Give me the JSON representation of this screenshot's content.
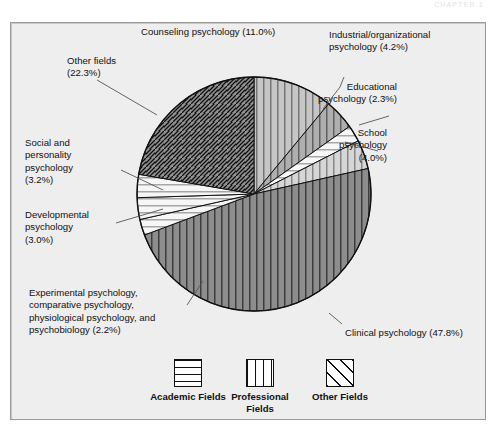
{
  "running_head": "CHAPTER 1",
  "figure": {
    "background_color": "#eeeeee",
    "border_color": "#9a9a9a"
  },
  "chart_data": {
    "type": "pie",
    "title": "",
    "unit": "%",
    "total": 100.0,
    "legend_position": "bottom",
    "grid": false,
    "categories": [
      "Counseling psychology",
      "Industrial/organizational psychology",
      "Educational psychology",
      "School psychology",
      "Clinical psychology",
      "Experimental psychology, comparative psychology, physiological psychology, and psychobiology",
      "Developmental psychology",
      "Social and personality psychology",
      "Other fields"
    ],
    "values": [
      11.0,
      4.2,
      2.3,
      4.0,
      47.8,
      2.2,
      3.0,
      3.2,
      22.3
    ],
    "groups": [
      "Professional Fields",
      "Professional Fields",
      "Academic Fields",
      "Professional Fields",
      "Professional Fields",
      "Academic Fields",
      "Academic Fields",
      "Academic Fields",
      "Other Fields"
    ],
    "slices": [
      {
        "label": "Counseling psychology",
        "value": 11.0,
        "display": "Counseling psychology (11.0%)",
        "group": "Professional Fields",
        "fill": "#9c9c9c",
        "pattern": "vertical"
      },
      {
        "label": "Industrial/organizational psychology",
        "value": 4.2,
        "display": "Industrial/organizational psychology (4.2%)",
        "group": "Professional Fields",
        "fill": "#767676",
        "pattern": "vertical"
      },
      {
        "label": "Educational psychology",
        "value": 2.3,
        "display": "Educational psychology (2.3%)",
        "group": "Academic Fields",
        "fill": "#f2f2f2",
        "pattern": "horizontal"
      },
      {
        "label": "School psychology",
        "value": 4.0,
        "display": "School psychology (4.0%)",
        "group": "Professional Fields",
        "fill": "#b9b9b9",
        "pattern": "vertical"
      },
      {
        "label": "Clinical psychology",
        "value": 47.8,
        "display": "Clinical psychology (47.8%)",
        "group": "Professional Fields",
        "fill": "#3a3a3a",
        "pattern": "vertical"
      },
      {
        "label": "Experimental psychology, comparative psychology, physiological psychology, and psychobiology",
        "value": 2.2,
        "display": "Experimental psychology, comparative psychology, physiological psychology, and psychobiology (2.2%)",
        "group": "Academic Fields",
        "fill": "#efefef",
        "pattern": "horizontal"
      },
      {
        "label": "Developmental psychology",
        "value": 3.0,
        "display": "Developmental psychology (3.0%)",
        "group": "Academic Fields",
        "fill": "#efefef",
        "pattern": "horizontal"
      },
      {
        "label": "Social and personality psychology",
        "value": 3.2,
        "display": "Social and personality psychology (3.2%)",
        "group": "Academic Fields",
        "fill": "#efefef",
        "pattern": "horizontal"
      },
      {
        "label": "Other fields",
        "value": 22.3,
        "display": "Other fields (22.3%)",
        "group": "Other Fields",
        "fill": "#0d0d0d",
        "pattern": "diagonal"
      }
    ]
  },
  "callouts": {
    "counseling": "Counseling psychology (11.0%)",
    "industrial": "Industrial/organizational\npsychology (4.2%)",
    "educational": "Educational\npsychology (2.3%)",
    "school": "School\npsychology\n(4.0%)",
    "clinical": "Clinical psychology (47.8%)",
    "experimental": "Experimental psychology,\ncomparative psychology,\nphysiological psychology, and\npsychobiology (2.2%)",
    "developmental": "Developmental\npsychology\n(3.0%)",
    "social": "Social and\npersonality\npsychology\n(3.2%)",
    "other_fields": "Other fields\n(22.3%)"
  },
  "legend": {
    "items": [
      {
        "label": "Academic\nFields",
        "pattern": "horizontal"
      },
      {
        "label": "Professional\nFields",
        "pattern": "vertical"
      },
      {
        "label": "Other\nFields",
        "pattern": "diagonal"
      }
    ]
  }
}
